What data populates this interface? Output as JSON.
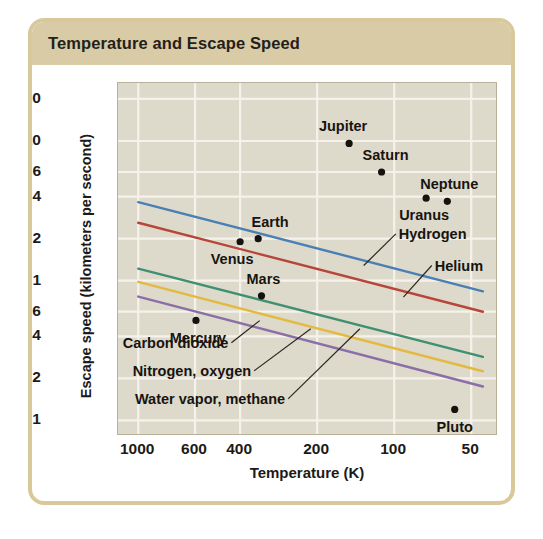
{
  "title": "Temperature and Escape Speed",
  "axes": {
    "x_label": "Temperature (K)",
    "y_label": "Escape speed (kilometers per second)"
  },
  "chart_data": {
    "type": "scatter",
    "title": "Temperature and Escape Speed",
    "xlabel": "Temperature (K)",
    "ylabel": "Escape speed (kilometers per second)",
    "x_scale": "log-reversed",
    "y_scale": "log",
    "xlim": [
      1200,
      40
    ],
    "ylim": [
      0.08,
      26
    ],
    "grid": true,
    "legend": "inline-labels",
    "xticks": [
      "1000",
      "600",
      "400",
      "200",
      "100",
      "50"
    ],
    "xtick_values": [
      1000,
      600,
      400,
      200,
      100,
      50
    ],
    "yticks": [
      "20",
      "10",
      "6",
      "4",
      "2",
      "1",
      "0.6",
      "0.4",
      "0.2",
      "0.1"
    ],
    "ytick_values": [
      20,
      10,
      6,
      4,
      2,
      1,
      0.6,
      0.4,
      0.2,
      0.1
    ],
    "points": [
      {
        "name": "Jupiter",
        "x": 150,
        "y": 9.6,
        "label_dx": -6,
        "label_dy": -17
      },
      {
        "name": "Saturn",
        "x": 112,
        "y": 6.0,
        "label_dx": 4,
        "label_dy": -17
      },
      {
        "name": "Neptune",
        "x": 62,
        "y": 3.7,
        "label_dx": 2,
        "label_dy": -17
      },
      {
        "name": "Uranus",
        "x": 75,
        "y": 3.9,
        "label_dx": -2,
        "label_dy": 17
      },
      {
        "name": "Earth",
        "x": 340,
        "y": 2.0,
        "label_dx": 12,
        "label_dy": -17
      },
      {
        "name": "Venus",
        "x": 400,
        "y": 1.9,
        "label_dx": -8,
        "label_dy": 17
      },
      {
        "name": "Mars",
        "x": 330,
        "y": 0.78,
        "label_dx": 2,
        "label_dy": -17
      },
      {
        "name": "Mercury",
        "x": 595,
        "y": 0.52,
        "label_dx": 2,
        "label_dy": 18
      },
      {
        "name": "Pluto",
        "x": 58,
        "y": 0.12,
        "label_dx": 0,
        "label_dy": 18
      }
    ],
    "series": [
      {
        "name": "Hydrogen",
        "color": "#4a7fb5",
        "x0": 1000,
        "y0": 3.65,
        "x1": 45,
        "y1": 0.84
      },
      {
        "name": "Helium",
        "color": "#b8453a",
        "x0": 1000,
        "y0": 2.6,
        "x1": 45,
        "y1": 0.6
      },
      {
        "name": "Carbon dioxide",
        "color": "#3f8f73",
        "x0": 1000,
        "y0": 1.22,
        "x1": 45,
        "y1": 0.285
      },
      {
        "name": "Nitrogen, oxygen",
        "color": "#e3b93f",
        "x0": 1000,
        "y0": 0.98,
        "x1": 45,
        "y1": 0.225
      },
      {
        "name": "Water vapor, methane",
        "color": "#8b6ea8",
        "x0": 1000,
        "y0": 0.77,
        "x1": 45,
        "y1": 0.175
      }
    ],
    "annotations": [
      {
        "text": "Hydrogen",
        "align": "left",
        "tx": 0.735,
        "ty": 0.43,
        "lx": 0.65,
        "ly": 0.52
      },
      {
        "text": "Helium",
        "align": "left",
        "tx": 0.83,
        "ty": 0.52,
        "lx": 0.755,
        "ly": 0.61
      },
      {
        "text": "Carbon dioxide",
        "align": "right",
        "tx": 0.3,
        "ty": 0.74,
        "lx": 0.375,
        "ly": 0.677
      },
      {
        "text": "Nitrogen, oxygen",
        "align": "right",
        "tx": 0.36,
        "ty": 0.82,
        "lx": 0.51,
        "ly": 0.7
      },
      {
        "text": "Water vapor, methane",
        "align": "right",
        "tx": 0.45,
        "ty": 0.9,
        "lx": 0.64,
        "ly": 0.7
      }
    ]
  }
}
